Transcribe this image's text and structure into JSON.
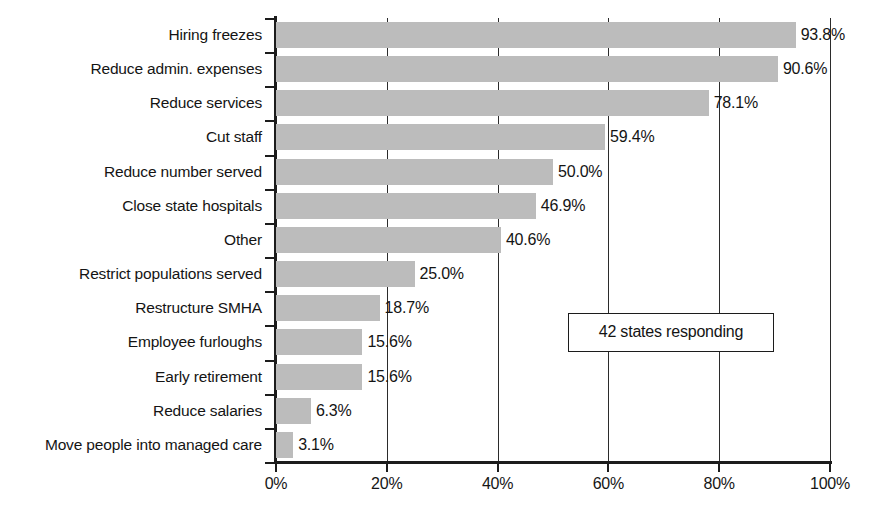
{
  "chart_data": {
    "type": "bar",
    "orientation": "horizontal",
    "title": "",
    "subtitle": "",
    "xlabel": "",
    "ylabel": "",
    "xlim": [
      0,
      100
    ],
    "grid": true,
    "legend": null,
    "value_suffix": "%",
    "categories": [
      "Hiring freezes",
      "Reduce admin. expenses",
      "Reduce services",
      "Cut staff",
      "Reduce number served",
      "Close state hospitals",
      "Other",
      "Restrict populations served",
      "Restructure SMHA",
      "Employee furloughs",
      "Early retirement",
      "Reduce salaries",
      "Move people into managed care"
    ],
    "values": [
      93.8,
      90.6,
      78.1,
      59.4,
      50.0,
      46.9,
      40.6,
      25.0,
      18.7,
      15.6,
      15.6,
      6.3,
      3.1
    ],
    "data_labels": [
      "93.8%",
      "90.6%",
      "78.1%",
      "59.4%",
      "50.0%",
      "46.9%",
      "40.6%",
      "25.0%",
      "18.7%",
      "15.6%",
      "15.6%",
      "6.3%",
      "3.1%"
    ],
    "xticks": [
      0,
      20,
      40,
      60,
      80,
      100
    ],
    "xtick_labels": [
      "0%",
      "20%",
      "40%",
      "60%",
      "80%",
      "100%"
    ],
    "annotations": [
      {
        "text": "42 states responding",
        "x": 53,
        "y_row": 9
      }
    ],
    "colors": {
      "bar_fill": "#bcbcbc",
      "axis": "#1c1c1c",
      "gridline": "#2b2b2b",
      "text": "#141414",
      "background": "#ffffff"
    }
  }
}
